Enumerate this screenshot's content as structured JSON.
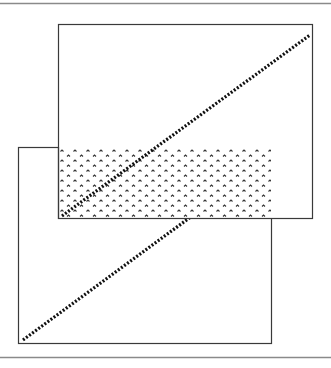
{
  "figure": {
    "description": "Two overlapping rectangles, each with a dotted diagonal line; the overlapping region is filled with a caret pattern",
    "width": 331,
    "height": 368,
    "colors": {
      "background": "#ffffff",
      "border": "#3a3a3a",
      "rule": "#8a8a8a",
      "dots": "#111111",
      "pattern": "#333333"
    }
  },
  "rules": {
    "top": {
      "x1": 0,
      "x2": 331,
      "y": 3
    },
    "bottom": {
      "x1": 0,
      "x2": 331,
      "y": 357
    }
  },
  "rectangles": {
    "lower": {
      "x": 18,
      "y": 147,
      "width": 253,
      "height": 196
    },
    "upper": {
      "x": 58,
      "y": 24,
      "width": 254,
      "height": 194
    }
  },
  "overlap": {
    "x": 58,
    "y": 147,
    "width": 213,
    "height": 71,
    "pattern": "caret"
  },
  "dotted_lines": {
    "upper": {
      "x1": 62,
      "y1": 216,
      "x2": 310,
      "y2": 35
    },
    "lower": {
      "x1": 23,
      "y1": 340,
      "x2": 271,
      "y2": 158
    }
  }
}
